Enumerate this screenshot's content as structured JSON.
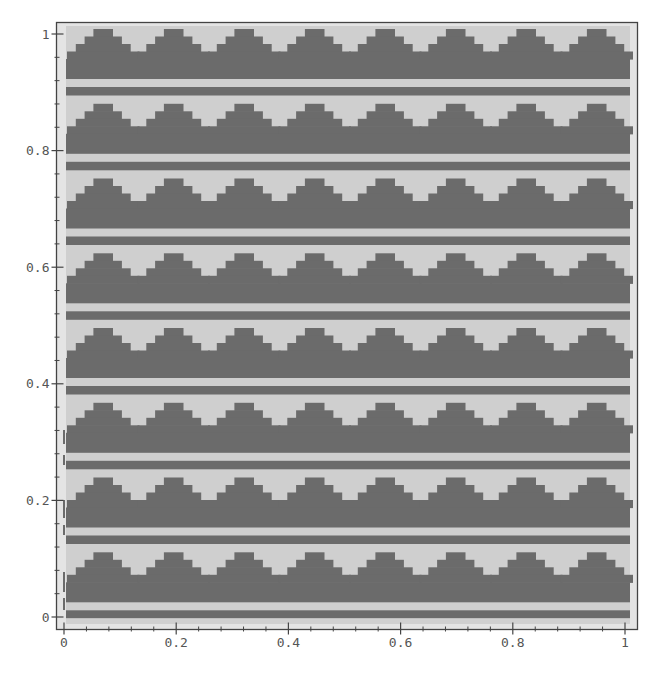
{
  "chart_data": {
    "type": "heatmap",
    "title": "",
    "xlabel": "",
    "ylabel": "",
    "xlim": [
      0,
      1
    ],
    "ylim": [
      0,
      1
    ],
    "grid": false,
    "legend": null,
    "x_ticks": [
      0,
      0.2,
      0.4,
      0.6,
      0.8,
      1
    ],
    "x_tick_labels": [
      "0",
      "0.2",
      "0.4",
      "0.6",
      "0.8",
      "1"
    ],
    "y_ticks": [
      0,
      0.2,
      0.4,
      0.6,
      0.8,
      1
    ],
    "y_tick_labels": [
      "0",
      "0.2",
      "0.4",
      "0.6",
      "0.8",
      "1"
    ],
    "x_minor_per_major": 5,
    "y_minor_per_major": 5,
    "pattern": {
      "description": "Binary two-tone tiling of stepped (staircase) triangles over solid bars, repeated in 8 horizontal bands with 8 triangles per band",
      "bands": 8,
      "triangles_per_band": 8,
      "triangle_steps": 4,
      "band_layers_top_to_bottom": [
        "stepped triangles",
        "solid dark bar",
        "light stripe",
        "dark stripe"
      ],
      "levels": [
        "light",
        "dark"
      ]
    },
    "colors": {
      "light": "#cfcfcf",
      "dark": "#6b6b6b",
      "background_margin": "#e4e4e4",
      "axis": "#444444"
    }
  }
}
